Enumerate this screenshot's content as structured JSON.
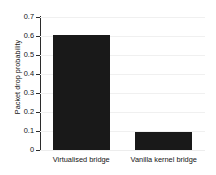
{
  "chart_data": {
    "type": "bar",
    "title": "",
    "xlabel": "",
    "ylabel": "Packet drop probability",
    "categories": [
      "Virtualised bridge",
      "Vanilla kernel bridge"
    ],
    "values": [
      0.605,
      0.095
    ],
    "ylim": [
      0,
      0.7
    ],
    "ytick_labels": [
      "0",
      "0.1",
      "0.2",
      "0.3",
      "0.4",
      "0.5",
      "0.6",
      "0.7"
    ],
    "ytick_values": [
      0,
      0.1,
      0.2,
      0.3,
      0.4,
      0.5,
      0.6,
      0.7
    ],
    "grid": "horizontal",
    "legend": "none",
    "bar_color": "#191919",
    "gridline_color": "#f0f0f0",
    "axis_color": "#2b2b2b",
    "text_color": "#131313",
    "background_color": "#ffffff"
  }
}
